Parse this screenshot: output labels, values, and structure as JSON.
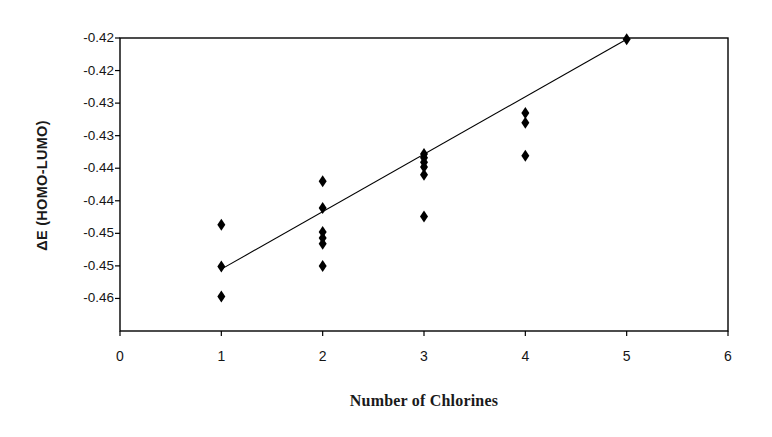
{
  "chart_data": {
    "type": "scatter",
    "title": "",
    "xlabel": "Number of Chlorines",
    "ylabel": "ΔE  (HOMO-LUMO)",
    "xlim": [
      0,
      6
    ],
    "ylim": [
      -0.46,
      -0.415
    ],
    "grid": false,
    "legend": null,
    "marker": "diamond",
    "marker_color": "#000000",
    "xticks": [
      0,
      1,
      2,
      3,
      4,
      5,
      6
    ],
    "xtick_labels": [
      "0",
      "1",
      "2",
      "3",
      "4",
      "5",
      "6"
    ],
    "yticks": [
      -0.415,
      -0.42,
      -0.425,
      -0.43,
      -0.435,
      -0.44,
      -0.445,
      -0.45,
      -0.455
    ],
    "ytick_labels": [
      "-0.42",
      "-0.42",
      "-0.43",
      "-0.43",
      "-0.44",
      "-0.44",
      "-0.45",
      "-0.45",
      "-0.46"
    ],
    "points": [
      {
        "x": 1,
        "y": -0.4437
      },
      {
        "x": 1,
        "y": -0.4501
      },
      {
        "x": 1,
        "y": -0.4547
      },
      {
        "x": 2,
        "y": -0.437
      },
      {
        "x": 2,
        "y": -0.4411
      },
      {
        "x": 2,
        "y": -0.4448
      },
      {
        "x": 2,
        "y": -0.4457
      },
      {
        "x": 2,
        "y": -0.4466
      },
      {
        "x": 2,
        "y": -0.45
      },
      {
        "x": 3,
        "y": -0.4328
      },
      {
        "x": 3,
        "y": -0.4334
      },
      {
        "x": 3,
        "y": -0.4341
      },
      {
        "x": 3,
        "y": -0.4348
      },
      {
        "x": 3,
        "y": -0.436
      },
      {
        "x": 3,
        "y": -0.4424
      },
      {
        "x": 4,
        "y": -0.4265
      },
      {
        "x": 4,
        "y": -0.428
      },
      {
        "x": 4,
        "y": -0.4331
      },
      {
        "x": 5,
        "y": -0.4152
      }
    ],
    "trendline": {
      "x_start": 1,
      "y_start": -0.4505,
      "x_end": 5,
      "y_end": -0.4152,
      "color": "#000000"
    }
  },
  "axes": {
    "frame_color": "#000000"
  }
}
